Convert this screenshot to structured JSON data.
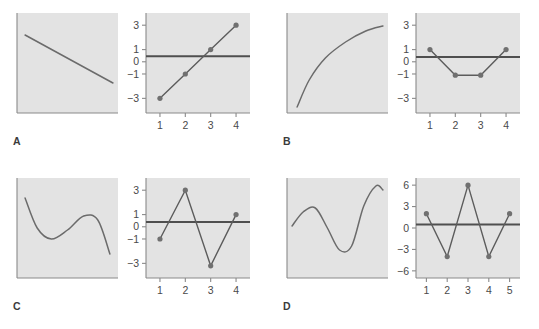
{
  "figure": {
    "background_color": "#ffffff",
    "plot_fill_color": "#e3e3e3",
    "axis_color": "#8a8a8a",
    "line_color": "#6b6b6b",
    "data_line_color": "#5c5c5c",
    "point_color": "#707070",
    "reference_line_color": "#4f4f4f",
    "tick_text_color": "#4a4a4a"
  },
  "panels": [
    {
      "label": "A",
      "left_plot": {
        "type": "line",
        "description": "straight descending line",
        "axes": {
          "x_ticks": [],
          "y_ticks": []
        },
        "x": [
          0.08,
          0.95
        ],
        "y": [
          0.78,
          0.3
        ]
      },
      "right_plot": {
        "type": "scatter",
        "title": "",
        "xlabel": "",
        "ylabel": "",
        "categories": [
          1,
          2,
          3,
          4
        ],
        "x_tick_labels": [
          "1",
          "2",
          "3",
          "4"
        ],
        "y_tick_labels": [
          "3",
          "1",
          "0",
          "-1",
          "-3"
        ],
        "y_tick_values": [
          3,
          1,
          0,
          -1,
          -3
        ],
        "ylim": [
          -4.2,
          4.0
        ],
        "xlim": [
          0.45,
          4.55
        ],
        "values": [
          -3,
          -1,
          1,
          3
        ],
        "reference_line_y": 0.45,
        "connect_points": true,
        "grid": false
      }
    },
    {
      "label": "B",
      "left_plot": {
        "type": "line",
        "description": "concave increasing logarithmic curve",
        "axes": {
          "x_ticks": [],
          "y_ticks": []
        },
        "x": [
          0.1,
          0.22,
          0.38,
          0.58,
          0.78,
          0.95
        ],
        "y": [
          0.06,
          0.33,
          0.55,
          0.71,
          0.82,
          0.87
        ]
      },
      "right_plot": {
        "type": "scatter",
        "title": "",
        "xlabel": "",
        "ylabel": "",
        "categories": [
          1,
          2,
          3,
          4
        ],
        "x_tick_labels": [
          "1",
          "2",
          "3",
          "4"
        ],
        "y_tick_labels": [
          "3",
          "1",
          "0",
          "-1",
          "-3"
        ],
        "y_tick_values": [
          3,
          1,
          0,
          -1,
          -3
        ],
        "ylim": [
          -4.2,
          4.0
        ],
        "xlim": [
          0.45,
          4.55
        ],
        "values": [
          1,
          -1.1,
          -1.1,
          1
        ],
        "reference_line_y": 0.4,
        "connect_points": true,
        "grid": false
      }
    },
    {
      "label": "C",
      "left_plot": {
        "type": "line",
        "description": "cubic wave curve rising then falling",
        "axes": {
          "x_ticks": [],
          "y_ticks": []
        },
        "x": [
          0.08,
          0.2,
          0.34,
          0.5,
          0.66,
          0.8,
          0.92
        ],
        "y": [
          0.8,
          0.5,
          0.39,
          0.48,
          0.62,
          0.58,
          0.24
        ]
      },
      "right_plot": {
        "type": "scatter",
        "title": "",
        "xlabel": "",
        "ylabel": "",
        "categories": [
          1,
          2,
          3,
          4
        ],
        "x_tick_labels": [
          "1",
          "2",
          "3",
          "4"
        ],
        "y_tick_labels": [
          "3",
          "1",
          "0",
          "-1",
          "-3"
        ],
        "y_tick_values": [
          3,
          1,
          0,
          -1,
          -3
        ],
        "ylim": [
          -4.2,
          4.0
        ],
        "xlim": [
          0.45,
          4.55
        ],
        "values": [
          -1,
          3,
          -3.2,
          1
        ],
        "reference_line_y": 0.4,
        "connect_points": true,
        "grid": false
      }
    },
    {
      "label": "D",
      "left_plot": {
        "type": "line",
        "description": "sine-like S curve with terminal hook",
        "axes": {
          "x_ticks": [],
          "y_ticks": []
        },
        "x": [
          0.05,
          0.16,
          0.28,
          0.4,
          0.52,
          0.64,
          0.76,
          0.88,
          0.95
        ],
        "y": [
          0.52,
          0.66,
          0.7,
          0.5,
          0.28,
          0.32,
          0.72,
          0.92,
          0.88
        ]
      },
      "right_plot": {
        "type": "scatter",
        "title": "",
        "xlabel": "",
        "ylabel": "",
        "categories": [
          1,
          2,
          3,
          4,
          5
        ],
        "x_tick_labels": [
          "1",
          "2",
          "3",
          "4",
          "5"
        ],
        "y_tick_labels": [
          "6",
          "3",
          "0",
          "-3",
          "-6"
        ],
        "y_tick_values": [
          6,
          3,
          0,
          -3,
          -6
        ],
        "ylim": [
          -7.0,
          7.0
        ],
        "xlim": [
          0.5,
          5.5
        ],
        "values": [
          2,
          -4,
          6,
          -4,
          2
        ],
        "reference_line_y": 0.5,
        "connect_points": true,
        "grid": false
      }
    }
  ],
  "chart_data": {
    "type": "scatter",
    "title": "",
    "subtitle": "",
    "xlabel": "",
    "ylabel": "",
    "grid": false,
    "legend": "none",
    "panels": [
      {
        "panel": "A",
        "left": {
          "type": "line",
          "shape": "linear decreasing"
        },
        "right": {
          "type": "scatter",
          "x": [
            1,
            2,
            3,
            4
          ],
          "y": [
            -3,
            -1,
            1,
            3
          ],
          "ylim": [
            -4.2,
            4.0
          ],
          "yticks": [
            3,
            1,
            0,
            -1,
            -3
          ],
          "xticks": [
            1,
            2,
            3,
            4
          ],
          "reference_line": 0.45
        }
      },
      {
        "panel": "B",
        "left": {
          "type": "line",
          "shape": "logarithmic increasing"
        },
        "right": {
          "type": "scatter",
          "x": [
            1,
            2,
            3,
            4
          ],
          "y": [
            1,
            -1.1,
            -1.1,
            1
          ],
          "ylim": [
            -4.2,
            4.0
          ],
          "yticks": [
            3,
            1,
            0,
            -1,
            -3
          ],
          "xticks": [
            1,
            2,
            3,
            4
          ],
          "reference_line": 0.4
        }
      },
      {
        "panel": "C",
        "left": {
          "type": "line",
          "shape": "cubic wave"
        },
        "right": {
          "type": "scatter",
          "x": [
            1,
            2,
            3,
            4
          ],
          "y": [
            -1,
            3,
            -3.2,
            1
          ],
          "ylim": [
            -4.2,
            4.0
          ],
          "yticks": [
            3,
            1,
            0,
            -1,
            -3
          ],
          "xticks": [
            1,
            2,
            3,
            4
          ],
          "reference_line": 0.4
        }
      },
      {
        "panel": "D",
        "left": {
          "type": "line",
          "shape": "sine S-curve"
        },
        "right": {
          "type": "scatter",
          "x": [
            1,
            2,
            3,
            4,
            5
          ],
          "y": [
            2,
            -4,
            6,
            -4,
            2
          ],
          "ylim": [
            -7.0,
            7.0
          ],
          "yticks": [
            6,
            3,
            0,
            -3,
            -6
          ],
          "xticks": [
            1,
            2,
            3,
            4,
            5
          ],
          "reference_line": 0.5
        }
      }
    ]
  }
}
